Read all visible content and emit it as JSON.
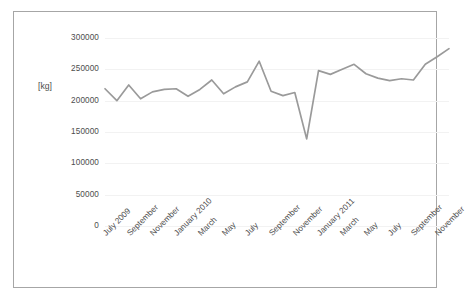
{
  "chart_data": {
    "type": "line",
    "title": "",
    "subtitle": "",
    "xlabel": "",
    "ylabel": "[kg]",
    "ylim": [
      0,
      300000
    ],
    "yticks": [
      0,
      50000,
      100000,
      150000,
      200000,
      250000,
      300000
    ],
    "ytick_labels": [
      "0",
      "50000",
      "100000",
      "150000",
      "200000",
      "250000",
      "300000"
    ],
    "grid": "horizontal",
    "legend": "none",
    "line_color": "#9a9a9a",
    "x": [
      "July 2009",
      "August 2009",
      "September 2009",
      "October 2009",
      "November 2009",
      "December 2009",
      "January 2010",
      "February 2010",
      "March 2010",
      "April 2010",
      "May 2010",
      "June 2010",
      "July 2010",
      "August 2010",
      "September 2010",
      "October 2010",
      "November 2010",
      "December 2010",
      "January 2011",
      "February 2011",
      "March 2011",
      "April 2011",
      "May 2011",
      "June 2011",
      "July 2011",
      "August 2011",
      "September 2011",
      "October 2011",
      "November 2011",
      "December 2011"
    ],
    "xtick_labels": [
      "July 2009",
      "September",
      "November",
      "January 2010",
      "March",
      "May",
      "July",
      "September",
      "November",
      "January 2011",
      "March",
      "May",
      "July",
      "September",
      "November"
    ],
    "xtick_indices": [
      0,
      2,
      4,
      6,
      8,
      10,
      12,
      14,
      16,
      18,
      20,
      22,
      24,
      26,
      28
    ],
    "values": [
      219000,
      200000,
      225000,
      203000,
      214000,
      218000,
      219000,
      207000,
      218000,
      233000,
      211000,
      222000,
      230000,
      263000,
      215000,
      208000,
      213000,
      139000,
      248000,
      242000,
      250000,
      258000,
      243000,
      236000,
      232000,
      235000,
      233000,
      258000,
      270000,
      283000
    ]
  }
}
